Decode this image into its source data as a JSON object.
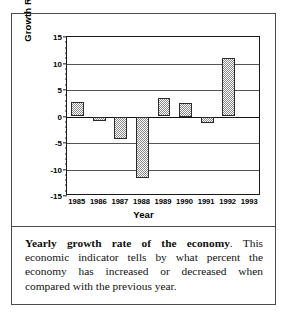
{
  "figure": {
    "caption_lead": "Yearly growth rate of the economy",
    "caption_body": ". This economic indicator tells by what percent the economy has increased or decreased when compared with the previous year."
  },
  "chart_data": {
    "type": "bar",
    "title": "",
    "xlabel": "Year",
    "ylabel": "Growth Rate (%)",
    "categories": [
      "1985",
      "1986",
      "1987",
      "1988",
      "1989",
      "1990",
      "1991",
      "1992",
      "1993"
    ],
    "values": [
      2.7,
      -0.8,
      -4.2,
      -11.6,
      3.5,
      2.5,
      -1.3,
      11.1,
      null
    ],
    "ylim": [
      -15,
      15
    ],
    "ytick_labels": [
      "15",
      "10",
      "5",
      "0",
      "-5",
      "-10",
      "-15"
    ],
    "ytick_values": [
      15,
      10,
      5,
      0,
      -5,
      -10,
      -15
    ],
    "yminor_step": 1,
    "grid": "horizontal",
    "legend": "none",
    "bar_fill": "#8a8a8a",
    "bar_edge": "#2b2b2b",
    "axis_color": "#1a1a1a"
  }
}
